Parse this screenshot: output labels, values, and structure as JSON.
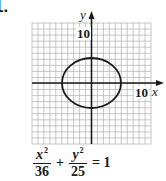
{
  "problem": {
    "number": "1."
  },
  "graph": {
    "grid": {
      "cells_x": 20,
      "cells_y": 20,
      "x_min": -10,
      "x_max": 10,
      "y_min": -10,
      "y_max": 10
    },
    "x_axis_label": "x",
    "y_axis_label": "y",
    "x_tick_label": "10",
    "y_tick_label": "10",
    "curve": {
      "type": "ellipse",
      "center": [
        0,
        0
      ],
      "semi_major_x": 6,
      "semi_minor_y": 5
    },
    "colors": {
      "grid": "#b8b8b8",
      "axis": "#1a1a1a",
      "curve": "#1a1a1a"
    }
  },
  "equation": {
    "term1_num": "x",
    "term1_exp": "2",
    "term1_den": "36",
    "plus": "+",
    "term2_num": "y",
    "term2_exp": "2",
    "term2_den": "25",
    "equals": "= 1"
  }
}
